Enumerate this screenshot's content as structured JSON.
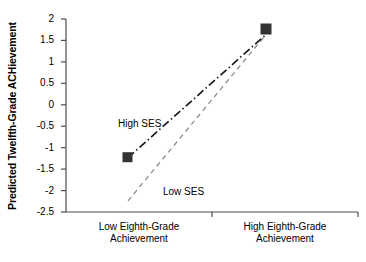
{
  "chart_data": {
    "type": "line",
    "title": "",
    "xlabel": "",
    "ylabel": "Predicted Twelfth-Grade ACHievement",
    "categories": [
      "Low Eighth-Grade Achievement",
      "High Eighth-Grade Achievement"
    ],
    "category_lines": [
      [
        "Low Eighth-Grade",
        "Achievement"
      ],
      [
        "High Eighth-Grade",
        "Achievement"
      ]
    ],
    "ylim": [
      -2.5,
      2
    ],
    "yticks": [
      "2",
      "1.5",
      "1",
      "0.5",
      "0",
      "-0.5",
      "-1",
      "-1.5",
      "-2",
      "-2.5"
    ],
    "ytick_values": [
      2,
      1.5,
      1,
      0.5,
      0,
      -0.5,
      -1,
      -1.5,
      -2,
      -2.5
    ],
    "grid": false,
    "legend_position": "inline-annotations",
    "series": [
      {
        "name": "High SES",
        "values": [
          -1.15,
          1.57
        ],
        "line_style": "dash-dot",
        "color": "#1a1a1a",
        "marker": "square",
        "label_x": 118,
        "label_y": 118
      },
      {
        "name": "Low SES",
        "values": [
          -2.25,
          1.57
        ],
        "line_style": "dashed",
        "color": "#8c8c8c",
        "marker": "none",
        "label_x": 163,
        "label_y": 186
      }
    ],
    "annotations": [
      "High SES",
      "Low SES"
    ],
    "colors": {
      "axis": "#4d4d4d",
      "high_ses_line": "#1a1a1a",
      "low_ses_line": "#8c8c8c",
      "marker_fill": "#333333",
      "text": "#000000",
      "background": "#ffffff"
    }
  }
}
